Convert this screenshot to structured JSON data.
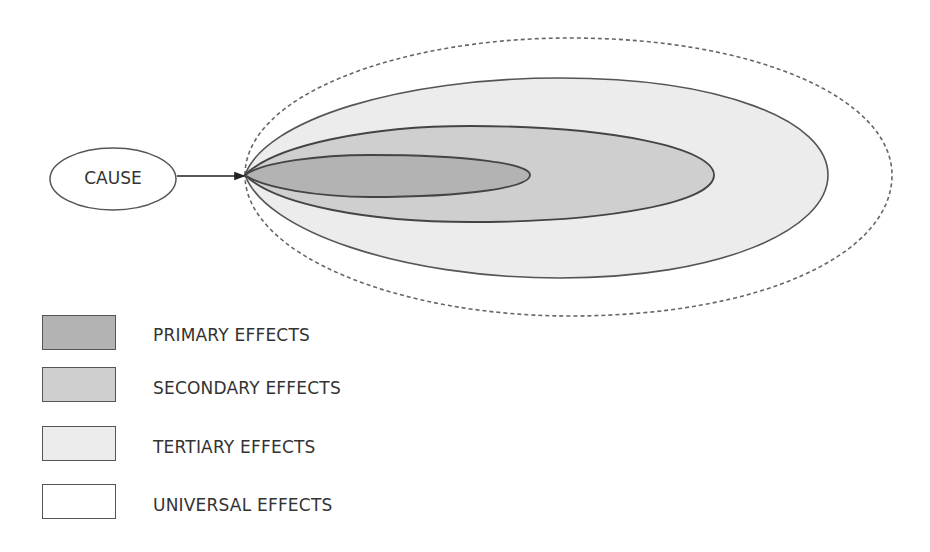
{
  "diagram": {
    "cause_label": "CAUSE",
    "regions": [
      {
        "name": "primary",
        "fill": "#b3b3b3"
      },
      {
        "name": "secondary",
        "fill": "#cfcfcf"
      },
      {
        "name": "tertiary",
        "fill": "#ececec"
      },
      {
        "name": "universal",
        "fill": "#ffffff",
        "border": "dashed"
      }
    ]
  },
  "legend": {
    "items": [
      {
        "label": "PRIMARY EFFECTS",
        "color": "#b3b3b3"
      },
      {
        "label": "SECONDARY EFFECTS",
        "color": "#cfcfcf"
      },
      {
        "label": "TERTIARY EFFECTS",
        "color": "#ececec"
      },
      {
        "label": "UNIVERSAL EFFECTS",
        "color": "#ffffff"
      }
    ]
  }
}
